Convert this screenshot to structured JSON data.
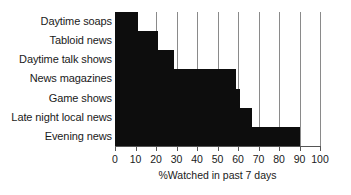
{
  "chart_data": {
    "type": "bar",
    "orientation": "horizontal",
    "title": "",
    "subtitle": "",
    "xlabel": "%Watched in past 7 days",
    "ylabel": "",
    "xlim": [
      0,
      100
    ],
    "xticks": [
      0,
      10,
      20,
      30,
      40,
      50,
      60,
      70,
      80,
      90,
      100
    ],
    "xtick_labels": [
      "0",
      "10",
      "20",
      "30",
      "40",
      "50",
      "60",
      "70",
      "80",
      "90",
      "100"
    ],
    "grid": true,
    "grid_axis": "x",
    "legend": false,
    "legend_position": "none",
    "categories": [
      "Daytime soaps",
      "Tabloid news",
      "Daytime talk shows",
      "News magazines",
      "Game shows",
      "Late night local news",
      "Evening news"
    ],
    "values": [
      11,
      21,
      29,
      59,
      61,
      67,
      90
    ],
    "series": [
      {
        "name": "%Watched in past 7 days",
        "values": [
          11,
          21,
          29,
          59,
          61,
          67,
          90
        ]
      }
    ],
    "bar_color": "#0d0d0d",
    "grid_color": "#8a8a8a",
    "axis_color": "#555555",
    "background_color": "#ffffff"
  }
}
